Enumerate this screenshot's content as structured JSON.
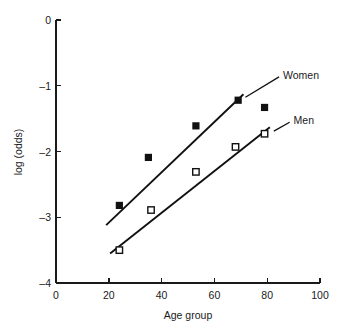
{
  "chart_data": {
    "type": "scatter",
    "title": "",
    "subtitle": "",
    "xlabel": "Age group",
    "ylabel": "log (odds)",
    "xlim": [
      0,
      100
    ],
    "ylim": [
      -4,
      0
    ],
    "xticks": [
      0,
      20,
      40,
      60,
      80,
      100
    ],
    "yticks": [
      0,
      -1,
      -2,
      -3,
      -4
    ],
    "xtick_labels": [
      "0",
      "20",
      "40",
      "60",
      "80",
      "100"
    ],
    "ytick_labels": [
      "0",
      "–1",
      "–2",
      "–3",
      "–4"
    ],
    "grid": false,
    "legend_position": "inline-annotations",
    "series": [
      {
        "name": "Women",
        "marker": "filled-square",
        "marker_color": "#111111",
        "x": [
          24,
          35,
          53,
          69,
          79
        ],
        "y": [
          -2.82,
          -2.09,
          -1.61,
          -1.22,
          -1.33
        ],
        "trendline": {
          "x0": 19,
          "y0": -3.12,
          "x1": 71,
          "y1": -1.13
        },
        "label": "Women",
        "label_x": 86,
        "label_y": -0.85
      },
      {
        "name": "Men",
        "marker": "open-square",
        "marker_color": "#111111",
        "x": [
          24,
          36,
          53,
          68,
          79
        ],
        "y": [
          -3.5,
          -2.89,
          -2.31,
          -1.93,
          -1.73
        ],
        "trendline": {
          "x0": 20.5,
          "y0": -3.55,
          "x1": 81,
          "y1": -1.63
        },
        "label": "Men",
        "label_x": 90,
        "label_y": -1.54
      }
    ],
    "annotations": [
      {
        "text": "Women",
        "x": 86,
        "y": -0.85
      },
      {
        "text": "Men",
        "x": 90,
        "y": -1.54
      }
    ]
  },
  "colors": {
    "axis": "#1a1a1a",
    "marker_filled": "#111111",
    "marker_open_stroke": "#111111",
    "marker_open_fill": "#ffffff",
    "trendline": "#111111",
    "background": "#ffffff"
  }
}
